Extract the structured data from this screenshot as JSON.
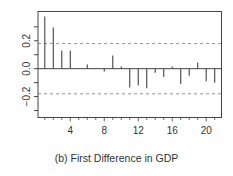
{
  "caption": "(b) First Difference in GDP",
  "chart_data": {
    "type": "bar",
    "subtype": "acf-stem",
    "title": "",
    "xlabel": "",
    "ylabel": "",
    "x": [
      1,
      2,
      3,
      4,
      5,
      6,
      7,
      8,
      9,
      10,
      11,
      12,
      13,
      14,
      15,
      16,
      17,
      18,
      19,
      20,
      21
    ],
    "values": [
      0.375,
      0.295,
      0.13,
      0.13,
      0.0,
      0.03,
      0.005,
      -0.02,
      0.095,
      0.015,
      -0.135,
      -0.12,
      -0.14,
      -0.03,
      -0.06,
      0.015,
      -0.11,
      -0.05,
      0.045,
      -0.09,
      -0.1
    ],
    "confidence_bounds": [
      0.18,
      -0.18
    ],
    "xticks": [
      4,
      8,
      12,
      16,
      20
    ],
    "yticks": [
      -0.3,
      -0.2,
      -0.1,
      0.0,
      0.1,
      0.2,
      0.3
    ],
    "ytick_labels": {
      "-0.2": "-0.2",
      "0.0": "0.0",
      "0.2": "0.2"
    },
    "xlim": [
      0.2,
      21.8
    ],
    "ylim": [
      -0.35,
      0.41
    ],
    "grid": false,
    "legend": null,
    "colors": {
      "stem": "#444444",
      "frame": "#444444",
      "dashed": "#777777",
      "text": "#333333"
    }
  }
}
